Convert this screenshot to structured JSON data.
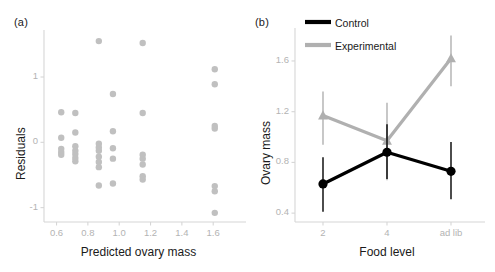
{
  "figure": {
    "background": "#ffffff",
    "panel_a_label": "(a)",
    "panel_b_label": "(b)"
  },
  "chart_data": [
    {
      "id": "panel-a",
      "type": "scatter",
      "title": "(a)",
      "xlabel": "Predicted ovary mass",
      "ylabel": "Residuals",
      "xlim": [
        0.52,
        1.72
      ],
      "ylim": [
        -1.22,
        1.72
      ],
      "xticks": [
        0.6,
        0.8,
        1.0,
        1.2,
        1.4,
        1.6
      ],
      "xtick_labels": [
        "0.6",
        "0.8",
        "1.0",
        "1.2",
        "1.4",
        "1.6"
      ],
      "yticks": [
        -1,
        0,
        1
      ],
      "ytick_labels": [
        "-1",
        "0",
        "1"
      ],
      "grid": false,
      "legend": "none",
      "point_color": "#c0c0c0",
      "point_radius": 3.2,
      "points": [
        {
          "x": 0.63,
          "y": 0.46
        },
        {
          "x": 0.63,
          "y": 0.07
        },
        {
          "x": 0.63,
          "y": -0.1
        },
        {
          "x": 0.63,
          "y": -0.15
        },
        {
          "x": 0.63,
          "y": -0.19
        },
        {
          "x": 0.72,
          "y": 0.45
        },
        {
          "x": 0.72,
          "y": 0.15
        },
        {
          "x": 0.72,
          "y": -0.06
        },
        {
          "x": 0.72,
          "y": -0.13
        },
        {
          "x": 0.72,
          "y": -0.18
        },
        {
          "x": 0.72,
          "y": -0.24
        },
        {
          "x": 0.72,
          "y": -0.29
        },
        {
          "x": 0.87,
          "y": 1.55
        },
        {
          "x": 0.87,
          "y": -0.02
        },
        {
          "x": 0.87,
          "y": -0.08
        },
        {
          "x": 0.87,
          "y": -0.13
        },
        {
          "x": 0.87,
          "y": -0.22
        },
        {
          "x": 0.87,
          "y": -0.3
        },
        {
          "x": 0.87,
          "y": -0.38
        },
        {
          "x": 0.87,
          "y": -0.66
        },
        {
          "x": 0.96,
          "y": 0.74
        },
        {
          "x": 0.96,
          "y": 0.17
        },
        {
          "x": 0.96,
          "y": -0.09
        },
        {
          "x": 0.96,
          "y": -0.25
        },
        {
          "x": 0.96,
          "y": -0.63
        },
        {
          "x": 1.15,
          "y": 1.52
        },
        {
          "x": 1.15,
          "y": 0.45
        },
        {
          "x": 1.15,
          "y": -0.19
        },
        {
          "x": 1.15,
          "y": -0.25
        },
        {
          "x": 1.15,
          "y": -0.34
        },
        {
          "x": 1.15,
          "y": -0.52
        },
        {
          "x": 1.15,
          "y": -0.57
        },
        {
          "x": 1.61,
          "y": 1.12
        },
        {
          "x": 1.61,
          "y": 0.89
        },
        {
          "x": 1.61,
          "y": 0.25
        },
        {
          "x": 1.61,
          "y": 0.21
        },
        {
          "x": 1.61,
          "y": -0.67
        },
        {
          "x": 1.61,
          "y": -0.75
        },
        {
          "x": 1.61,
          "y": -1.08
        }
      ]
    },
    {
      "id": "panel-b",
      "type": "line",
      "title": "(b)",
      "xlabel": "Food level",
      "ylabel": "Ovary mass",
      "categories": [
        "2",
        "4",
        "ad lib"
      ],
      "ylim": [
        0.33,
        1.86
      ],
      "yticks": [
        0.4,
        0.8,
        1.2,
        1.6
      ],
      "ytick_labels": [
        "0.4",
        "0.8",
        "1.2",
        "1.6"
      ],
      "grid": false,
      "legend_position": "top-right",
      "error_bars": "vertical",
      "series": [
        {
          "name": "Control",
          "color": "#000000",
          "marker": "circle",
          "values": [
            0.63,
            0.88,
            0.73
          ],
          "err_low": [
            0.41,
            0.67,
            0.51
          ],
          "err_high": [
            0.84,
            1.1,
            0.96
          ]
        },
        {
          "name": "Experimental",
          "color": "#b0b0b0",
          "marker": "triangle",
          "values": [
            1.17,
            0.97,
            1.62
          ],
          "err_low": [
            0.94,
            0.66,
            1.4
          ],
          "err_high": [
            1.36,
            1.27,
            1.8
          ]
        }
      ]
    }
  ]
}
